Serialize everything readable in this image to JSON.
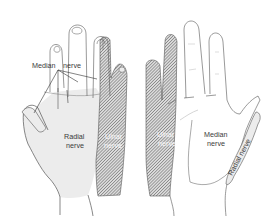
{
  "diagram": {
    "views": [
      {
        "name": "dorsal",
        "labels": {
          "median": "Median",
          "median_nerve_word": "nerve",
          "radial_1": "Radial",
          "radial_2": "nerve",
          "ulnar_1": "Ulnar",
          "ulnar_2": "nerve"
        }
      },
      {
        "name": "palmar",
        "labels": {
          "ulnar_1": "Ulnar",
          "ulnar_2": "nerve",
          "median_1": "Median",
          "median_2": "nerve",
          "radial": "Radial nerve"
        }
      }
    ],
    "colors": {
      "outline": "#555555",
      "radial_fill": "#ececec",
      "ulnar_hatch": "#6a6a6a",
      "background": "#ffffff"
    }
  }
}
